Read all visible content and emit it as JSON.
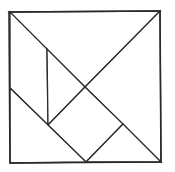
{
  "diagram": {
    "type": "tangram-square",
    "stroke_color": "#2a2a2a",
    "background": "#ffffff",
    "outer_square": [
      [
        9,
        12
      ],
      [
        160,
        11
      ],
      [
        161,
        162
      ],
      [
        10,
        163
      ]
    ],
    "pieces": [
      {
        "name": "large-triangle-top",
        "points": [
          [
            9,
            12
          ],
          [
            160,
            11
          ],
          [
            85,
            87
          ]
        ]
      },
      {
        "name": "large-triangle-right",
        "points": [
          [
            160,
            11
          ],
          [
            161,
            162
          ],
          [
            85,
            87
          ]
        ]
      },
      {
        "name": "parallelogram-left",
        "points": [
          [
            10,
            12
          ],
          [
            47,
            49
          ],
          [
            48,
            125
          ],
          [
            10,
            88
          ]
        ]
      },
      {
        "name": "small-triangle-middle",
        "points": [
          [
            47,
            49
          ],
          [
            85,
            87
          ],
          [
            48,
            125
          ]
        ]
      },
      {
        "name": "square-middle",
        "points": [
          [
            85,
            87
          ],
          [
            123,
            124
          ],
          [
            86,
            162
          ],
          [
            48,
            125
          ]
        ]
      },
      {
        "name": "small-triangle-right",
        "points": [
          [
            123,
            124
          ],
          [
            161,
            162
          ],
          [
            86,
            162
          ]
        ]
      },
      {
        "name": "medium-triangle-bottom-left",
        "points": [
          [
            10,
            88
          ],
          [
            86,
            162
          ],
          [
            10,
            163
          ]
        ]
      }
    ]
  }
}
